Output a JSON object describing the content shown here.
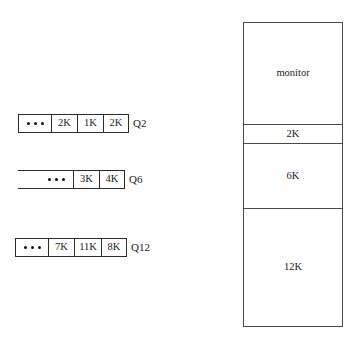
{
  "diagram": {
    "stroke_color": "#2b2b2b",
    "map_stroke_color": "#4a4a4a",
    "background": "#ffffff",
    "ellipsis_glyph": "dot"
  },
  "queues": [
    {
      "name": "queue-q2",
      "label": "Q2",
      "ellipsis": "• • •",
      "cells": [
        "2K",
        "1K",
        "2K"
      ]
    },
    {
      "name": "queue-q6",
      "label": "Q6",
      "ellipsis": "• • •",
      "cells": [
        "3K",
        "4K"
      ]
    },
    {
      "name": "queue-q12",
      "label": "Q12",
      "ellipsis": "• • •",
      "cells": [
        "7K",
        "11K",
        "8K"
      ]
    }
  ],
  "memory_map": {
    "name": "memory-map",
    "blocks": [
      {
        "label": "monitor"
      },
      {
        "label": "2K"
      },
      {
        "label": "6K"
      },
      {
        "label": "12K"
      }
    ]
  }
}
